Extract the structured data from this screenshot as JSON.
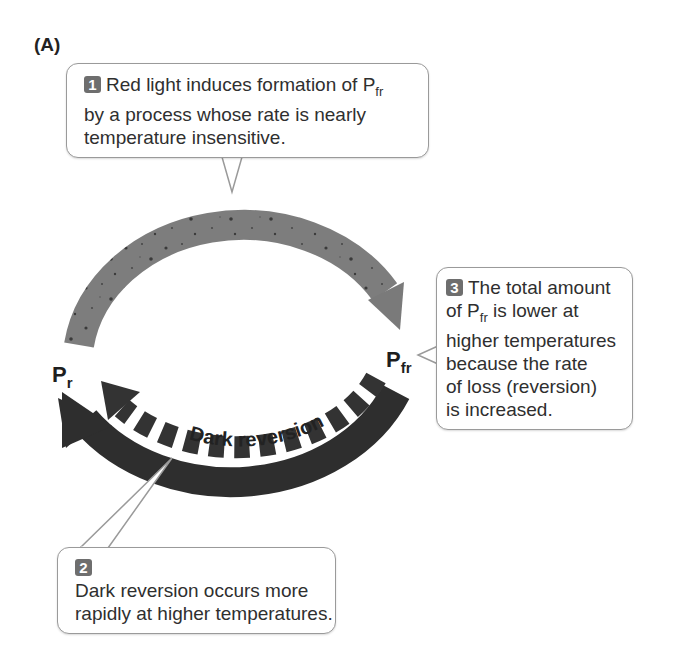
{
  "panel_label": "(A)",
  "callouts": [
    {
      "number": "1",
      "lines": [
        "Red light induces formation of P",
        "fr",
        "by a process whose rate is nearly",
        "temperature insensitive."
      ]
    },
    {
      "number": "2",
      "lines": [
        "Dark reversion occurs more",
        "rapidly at higher temperatures."
      ]
    },
    {
      "number": "3",
      "lines": [
        "The total amount",
        "of P",
        "fr",
        " is lower at",
        "higher temperatures",
        "because the rate",
        "of loss (reversion)",
        "is increased."
      ]
    }
  ],
  "nodes": {
    "pr": {
      "base": "P",
      "sub": "r"
    },
    "pfr": {
      "base": "P",
      "sub": "fr"
    }
  },
  "arrows": {
    "red_light": {
      "label": "Red light",
      "color": "#7a7a7a"
    },
    "far_red_light": {
      "label": "Far-red light",
      "color": "#2e2e2e"
    },
    "dark_reversion": {
      "label": "Dark reversion",
      "color": "#333333"
    }
  }
}
